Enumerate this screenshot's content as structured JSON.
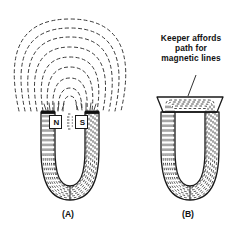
{
  "figure": {
    "type": "physics-illustration",
    "background_color": "#ffffff",
    "ink_color": "#1a1a1a"
  },
  "annotation": {
    "line1": "Keeper affords",
    "line2": "path for",
    "line3": "magnetic lines",
    "leader": "leader-line-to-keeper"
  },
  "panels": [
    {
      "id": "A",
      "caption": "(A)",
      "description": "Horseshoe magnet with open poles; magnetic lines leak into the air as concentric dashed arcs",
      "pole_labels": [
        {
          "label": "N",
          "side": "left"
        },
        {
          "label": "S",
          "side": "right"
        }
      ],
      "external_arcs": 9,
      "internal_lines": 8
    },
    {
      "id": "B",
      "caption": "(B)",
      "description": "Same horseshoe magnet closed by a keeper bar across the poles; lines stay inside the iron",
      "keeper": {
        "shape": "trapezoid",
        "name": "keeper-bar"
      },
      "external_arcs": 0,
      "internal_lines": 8
    }
  ],
  "colors": {
    "ink": "#1a1a1a",
    "dash": "#3a3a3a",
    "paper": "#ffffff",
    "pole_face": "#111111"
  }
}
